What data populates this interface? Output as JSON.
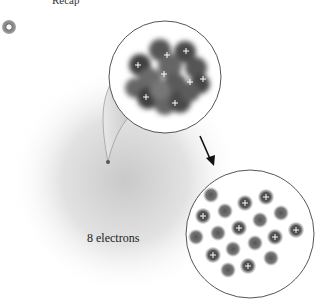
{
  "header": {
    "label": "Recap"
  },
  "figure": {
    "atom_label": "8 electrons",
    "nucleus_zoom": {
      "description": "Magnified nucleus: clustered nucleons",
      "proton_marks": [
        {
          "x": 167,
          "y": 55
        },
        {
          "x": 186,
          "y": 51
        },
        {
          "x": 138,
          "y": 65
        },
        {
          "x": 164,
          "y": 74
        },
        {
          "x": 190,
          "y": 82
        },
        {
          "x": 203,
          "y": 79
        },
        {
          "x": 146,
          "y": 97
        },
        {
          "x": 175,
          "y": 103
        }
      ]
    },
    "separated_nucleons": {
      "description": "Nucleons separated: 8 protons (+) and neutrons",
      "balls": [
        {
          "x": 211,
          "y": 195,
          "p": false
        },
        {
          "x": 245,
          "y": 203,
          "p": true
        },
        {
          "x": 266,
          "y": 197,
          "p": true
        },
        {
          "x": 203,
          "y": 216,
          "p": true
        },
        {
          "x": 225,
          "y": 211,
          "p": false
        },
        {
          "x": 239,
          "y": 228,
          "p": true
        },
        {
          "x": 260,
          "y": 220,
          "p": false
        },
        {
          "x": 281,
          "y": 213,
          "p": false
        },
        {
          "x": 296,
          "y": 230,
          "p": true
        },
        {
          "x": 196,
          "y": 237,
          "p": false
        },
        {
          "x": 218,
          "y": 233,
          "p": false
        },
        {
          "x": 275,
          "y": 237,
          "p": true
        },
        {
          "x": 255,
          "y": 243,
          "p": false
        },
        {
          "x": 233,
          "y": 249,
          "p": false
        },
        {
          "x": 213,
          "y": 255,
          "p": true
        },
        {
          "x": 271,
          "y": 258,
          "p": false
        },
        {
          "x": 248,
          "y": 266,
          "p": true
        },
        {
          "x": 228,
          "y": 270,
          "p": false
        }
      ]
    },
    "colors": {
      "nucleon_dark": "#3a3a3a",
      "nucleon_mid": "#6e6e6e",
      "cloud": "#d8d8d8",
      "outline": "#555555",
      "arrow": "#111111"
    }
  }
}
